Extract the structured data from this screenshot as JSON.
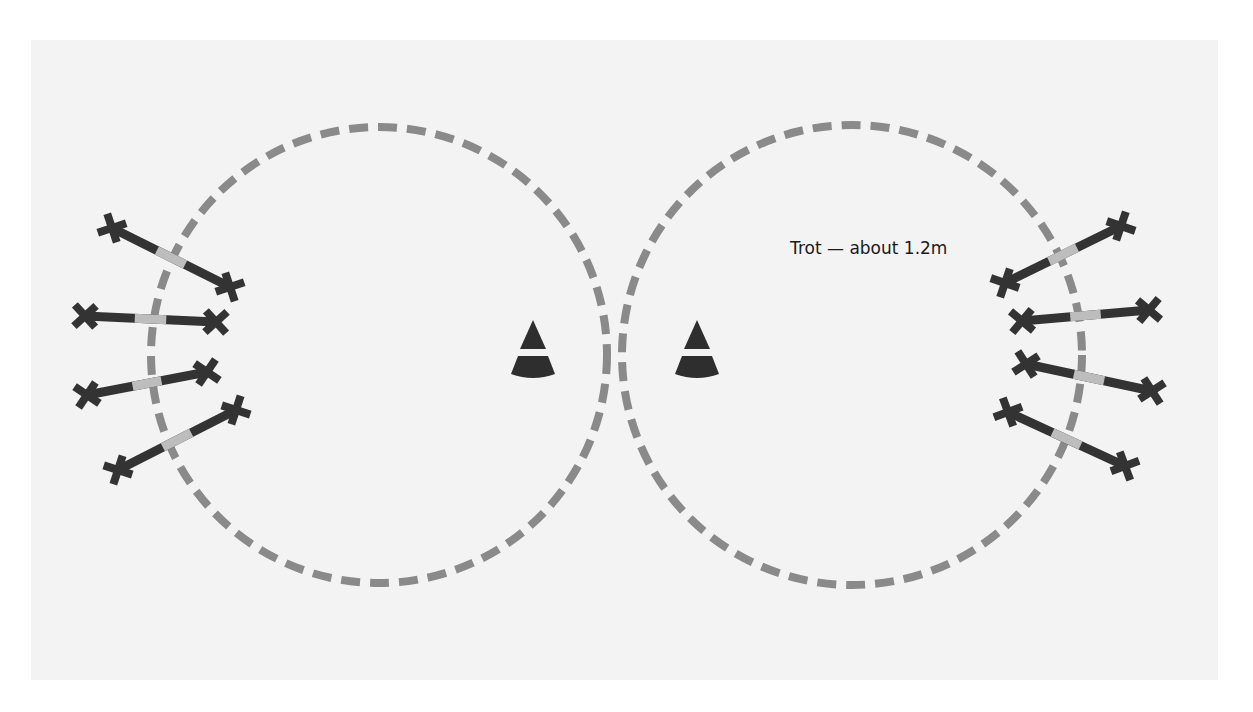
{
  "diagram": {
    "background": {
      "x": 31,
      "y": 40,
      "width": 1187,
      "height": 640,
      "color": "#f3f3f3"
    },
    "colors": {
      "circle_dash": "#8a8a8a",
      "pole_dark": "#333333",
      "pole_light": "#bdbdbd",
      "cone": "#2e2e2e",
      "cone_band": "#ffffff"
    },
    "circles": [
      {
        "name": "left-circle",
        "cx": 379,
        "cy": 355,
        "r": 228
      },
      {
        "name": "right-circle",
        "cx": 852,
        "cy": 355,
        "r": 230
      }
    ],
    "cones": [
      {
        "name": "left-cone",
        "x": 533,
        "y": 355
      },
      {
        "name": "right-cone",
        "x": 697,
        "y": 355
      }
    ],
    "annotation": {
      "text": "Trot — about 1.2m",
      "x": 790,
      "y": 254
    },
    "poles": [
      {
        "side": "left",
        "x1": 112,
        "y1": 228,
        "x2": 230,
        "y2": 287
      },
      {
        "side": "left",
        "x1": 85,
        "y1": 316,
        "x2": 216,
        "y2": 322
      },
      {
        "side": "left",
        "x1": 87,
        "y1": 395,
        "x2": 207,
        "y2": 372
      },
      {
        "side": "left",
        "x1": 118,
        "y1": 470,
        "x2": 236,
        "y2": 410
      },
      {
        "side": "right",
        "x1": 1005,
        "y1": 283,
        "x2": 1121,
        "y2": 226
      },
      {
        "side": "right",
        "x1": 1022,
        "y1": 321,
        "x2": 1149,
        "y2": 310
      },
      {
        "side": "right",
        "x1": 1026,
        "y1": 364,
        "x2": 1152,
        "y2": 391
      },
      {
        "side": "right",
        "x1": 1008,
        "y1": 412,
        "x2": 1125,
        "y2": 466
      }
    ]
  }
}
